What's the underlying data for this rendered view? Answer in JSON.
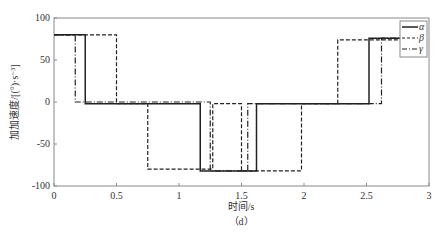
{
  "chart_data": {
    "type": "line",
    "title": "",
    "xlabel": "时间/s",
    "ylabel": "加加速度/[(°)·s⁻³]",
    "caption": "（d）",
    "xlim": [
      0,
      3
    ],
    "ylim": [
      -100,
      100
    ],
    "xticks": [
      "0",
      "0.5",
      "1",
      "1.5",
      "2",
      "2.5",
      "3"
    ],
    "yticks": [
      "100",
      "50",
      "0",
      "-50",
      "-100"
    ],
    "legend": {
      "position": "upper right",
      "entries": [
        "α",
        "β",
        "γ"
      ]
    },
    "series": [
      {
        "name": "α",
        "style": "solid",
        "x": [
          0,
          0.25,
          0.25,
          1.17,
          1.17,
          1.62,
          1.62,
          2.52,
          2.52,
          2.8
        ],
        "y": [
          80,
          80,
          -2,
          -2,
          -82,
          -82,
          -2,
          -2,
          76,
          76
        ]
      },
      {
        "name": "β",
        "style": "dashed",
        "x": [
          0,
          0.5,
          0.5,
          0.75,
          0.75,
          1.27,
          1.27,
          1.5,
          1.5,
          1.98,
          1.98,
          2.27,
          2.27,
          2.8
        ],
        "y": [
          80,
          80,
          -2,
          -2,
          -80,
          -80,
          -2,
          -2,
          -82,
          -82,
          -2,
          -2,
          74,
          74
        ]
      },
      {
        "name": "γ",
        "style": "dashdot",
        "x": [
          0,
          0.17,
          0.17,
          1.25,
          1.25,
          1.55,
          1.55,
          2.62,
          2.62,
          2.8
        ],
        "y": [
          80,
          80,
          0,
          0,
          -82,
          -82,
          -2,
          -2,
          76,
          76
        ]
      }
    ]
  }
}
